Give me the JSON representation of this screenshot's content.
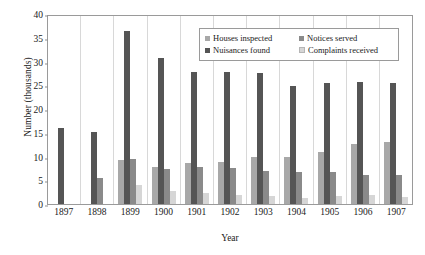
{
  "chart_data": {
    "type": "bar",
    "title": "",
    "xlabel": "Year",
    "ylabel": "Number (thousands)",
    "ylim": [
      0,
      40
    ],
    "yticks": [
      0,
      5,
      10,
      15,
      20,
      25,
      30,
      35,
      40
    ],
    "grid": false,
    "legend_position": "top-right inside plot",
    "categories": [
      "1897",
      "1898",
      "1899",
      "1900",
      "1901",
      "1902",
      "1903",
      "1904",
      "1905",
      "1906",
      "1907"
    ],
    "series": [
      {
        "name": "Houses inspected",
        "color": "#a8a8a8",
        "values": [
          null,
          null,
          9.2,
          7.8,
          8.6,
          8.8,
          9.9,
          9.9,
          11.0,
          12.7,
          13.1
        ]
      },
      {
        "name": "Nuisances found",
        "color": "#555555",
        "values": [
          15.9,
          15.1,
          36.5,
          30.7,
          27.8,
          27.7,
          27.5,
          24.8,
          25.4,
          25.7,
          25.5
        ]
      },
      {
        "name": "Notices served",
        "color": "#8a8a8a",
        "values": [
          null,
          5.4,
          9.4,
          7.4,
          7.8,
          7.5,
          7.0,
          6.8,
          6.7,
          6.2,
          6.1
        ]
      },
      {
        "name": "Complaints received",
        "color": "#d6d6d6",
        "values": [
          null,
          null,
          3.9,
          2.7,
          2.4,
          1.9,
          1.7,
          1.3,
          1.6,
          1.8,
          1.5
        ]
      }
    ]
  },
  "legend": {
    "items": [
      {
        "label": "Houses inspected"
      },
      {
        "label": "Notices served"
      },
      {
        "label": "Nuisances found"
      },
      {
        "label": "Complaints received"
      }
    ]
  }
}
